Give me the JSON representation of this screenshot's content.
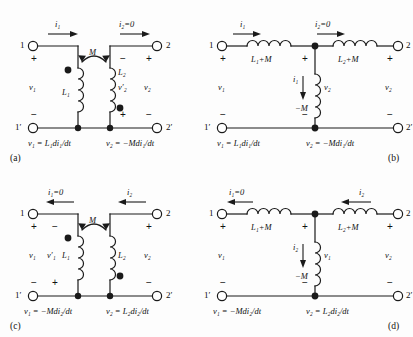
{
  "figure": {
    "stroke_color": "#1a1a1a",
    "background": "#fdfdfd"
  },
  "symbols": {
    "plus": "+",
    "minus": "−",
    "dot": "dot-marker"
  },
  "panels": [
    {
      "id": "a",
      "caption": "(a)",
      "type": "coupled-coils",
      "terminals": {
        "tl": "1",
        "tr": "2",
        "bl": "1′",
        "br": "2′"
      },
      "currents": [
        {
          "name": "i1",
          "label": "i₁",
          "direction": "right"
        },
        {
          "name": "i2",
          "label": "i₂=0",
          "direction": "right"
        }
      ],
      "coupling_label": "M",
      "coils": [
        {
          "name": "L1",
          "label": "L₁",
          "dot": "top-left"
        },
        {
          "name": "L2",
          "label": "L₂",
          "dot": "bottom-right"
        }
      ],
      "voltages": [
        {
          "name": "v1",
          "label": "v₁",
          "top_sign": "+",
          "bottom_sign": "−"
        },
        {
          "name": "v2prime",
          "label": "v′₂",
          "top_sign": "−",
          "bottom_sign": "+"
        },
        {
          "name": "v2",
          "label": "v₂",
          "top_sign": "+",
          "bottom_sign": "−"
        }
      ],
      "equations": [
        "v₁ = L₁di₁/dt",
        "v₂ = −Mdi₁/dt"
      ]
    },
    {
      "id": "b",
      "caption": "(b)",
      "type": "t-equivalent",
      "terminals": {
        "tl": "1",
        "tr": "2",
        "bl": "1′",
        "br": "2′"
      },
      "currents": [
        {
          "name": "i1",
          "label": "i₁",
          "direction": "right"
        },
        {
          "name": "i2",
          "label": "i₂=0",
          "direction": "right"
        },
        {
          "name": "i1-branch",
          "label": "i₁",
          "direction": "down"
        }
      ],
      "elements": [
        {
          "name": "left-inductor",
          "label": "L₁+M"
        },
        {
          "name": "right-inductor",
          "label": "L₂+M"
        },
        {
          "name": "shunt-inductor",
          "label": "−M"
        }
      ],
      "voltages": [
        {
          "name": "v1",
          "label": "v₁",
          "top_sign": "+",
          "bottom_sign": "−"
        },
        {
          "name": "v2-branch",
          "label": "v₂",
          "top_sign": "+",
          "bottom_sign": "−"
        },
        {
          "name": "v2",
          "label": "v₂",
          "top_sign": "+",
          "bottom_sign": "−"
        }
      ],
      "equations": [
        "v₁ = L₁di₁/dt",
        "v₂ = −Mdi₁/dt"
      ]
    },
    {
      "id": "c",
      "caption": "(c)",
      "type": "coupled-coils",
      "terminals": {
        "tl": "1",
        "tr": "2",
        "bl": "1′",
        "br": "2′"
      },
      "currents": [
        {
          "name": "i1",
          "label": "i₁=0",
          "direction": "left"
        },
        {
          "name": "i2",
          "label": "i₂",
          "direction": "left"
        }
      ],
      "coupling_label": "M",
      "coils": [
        {
          "name": "L1",
          "label": "L₁",
          "dot": "top-left"
        },
        {
          "name": "L2",
          "label": "L₂",
          "dot": "bottom-left"
        }
      ],
      "voltages": [
        {
          "name": "v1",
          "label": "v₁",
          "top_sign": "+",
          "bottom_sign": "−"
        },
        {
          "name": "v1prime",
          "label": "v′₁",
          "top_sign": "−",
          "bottom_sign": "+"
        },
        {
          "name": "v2",
          "label": "v₂",
          "top_sign": "+",
          "bottom_sign": "−"
        }
      ],
      "equations": [
        "v₁ = −Mdi₂/dt",
        "v₂ = L₂di₂/dt"
      ]
    },
    {
      "id": "d",
      "caption": "(d)",
      "type": "t-equivalent",
      "terminals": {
        "tl": "1",
        "tr": "2",
        "bl": "1′",
        "br": "2′"
      },
      "currents": [
        {
          "name": "i1",
          "label": "i₁=0",
          "direction": "left"
        },
        {
          "name": "i2",
          "label": "i₂",
          "direction": "left"
        },
        {
          "name": "i2-branch",
          "label": "i₂",
          "direction": "down"
        }
      ],
      "elements": [
        {
          "name": "left-inductor",
          "label": "L₁+M"
        },
        {
          "name": "right-inductor",
          "label": "L₂+M"
        },
        {
          "name": "shunt-inductor",
          "label": "−M"
        }
      ],
      "voltages": [
        {
          "name": "v1",
          "label": "v₁",
          "top_sign": "+",
          "bottom_sign": "−"
        },
        {
          "name": "v1-branch",
          "label": "v₁",
          "top_sign": "+",
          "bottom_sign": "−"
        },
        {
          "name": "v2",
          "label": "v₂",
          "top_sign": "+",
          "bottom_sign": "−"
        }
      ],
      "equations": [
        "v₁ = −Mdi₂/dt",
        "v₂ = L₂di₂/dt"
      ]
    }
  ]
}
